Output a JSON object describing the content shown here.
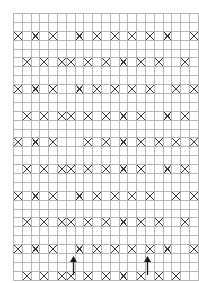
{
  "chart": {
    "type": "stitch-chart",
    "columns": 21,
    "rows": 30,
    "cell_width": 8.24,
    "cell_height": 7.9,
    "grid_left": 13,
    "grid_top": 13,
    "symbols": {
      "blank": "",
      "cross": "X",
      "fill": "■"
    },
    "colors": {
      "grid_line": "#b5b5b5",
      "fill": "#2b2b2b",
      "cross": "#3a3a3a",
      "background": "#ffffff",
      "arrow": "#1a1a1a"
    },
    "legend": {
      "cross_label": "X",
      "fill_label": "solid",
      "blank_label": "blank"
    },
    "repeat_markers": {
      "label": "repeat",
      "positions": [
        {
          "name": "repeat-start-arrow",
          "x": 73,
          "y": 256,
          "column": 7
        },
        {
          "name": "repeat-end-arrow",
          "x": 147,
          "y": 256,
          "column": 16
        }
      ]
    },
    "cells": [
      "0000f00f000000000000f",
      "000ff00ff0000000000ff",
      "x0x0x00x0x0x0x0x0x00x",
      "000ff00ff00000000000f",
      "0000ff0f000000000000f",
      "0x0x0xx0x0x0x0x0x00x0",
      "00f00000f0000000000f0",
      "00ff000ff000000000ff0",
      "x0x0x00x0x0x0x0x00x0x",
      "00ff000ff000000000ff0",
      "00f00000f0000000000f0",
      "0x0x0xx0x0x0x0x00x0x0",
      "f000000000f000000f000",
      "ff0000000ff00000ff000",
      "x0x0x000x0x0x0x0x0x0x",
      "ff0000000ff00000ff000",
      "f000000000f000000f000",
      "0x0x0xx0x0x0x0x00x0x0",
      "00f00000f0000000000f0",
      "00ff000ff000000000ff0",
      "x0x0x00x0x0x0x0x00x0x",
      "00ff000ff000000000ff0",
      "00f00000f0000000000f0",
      "0x0x0xx0x0x0x0x0x00x0",
      "0000f00f000000000000f",
      "000ff00ff0000000000ff",
      "x0x0x00x0x0x0x0x0x00x",
      "000ff00ff0000000000ff",
      "0000f00f000000000000f",
      "0x0x0xx0x0x0x0x0x0x00"
    ]
  }
}
